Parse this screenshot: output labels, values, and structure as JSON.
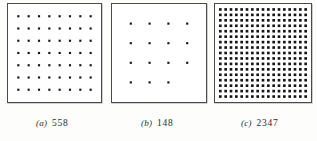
{
  "figure": {
    "background_color": "#fdfdfc",
    "dot_color": "#151513",
    "border_color": "#4a4a48"
  },
  "chart_data": {
    "type": "scatter",
    "title": "",
    "xlabel": "",
    "ylabel": "",
    "layout": "three square plates side by side, each filled with a regular square lattice of dots; an italic panel letter and an old-style numeral count are printed below each plate",
    "grid": false,
    "legend": false,
    "panels": [
      {
        "label": "(a)",
        "count_text": "558",
        "count_value": 558,
        "columns": 8,
        "rows": 7,
        "dots_drawn": 56,
        "dot_radius_px": 1.1,
        "density": "sparse",
        "plate": {
          "x": 7,
          "y": 3,
          "width": 95,
          "height": 100
        }
      },
      {
        "label": "(b)",
        "count_text": "148",
        "count_value": 148,
        "columns": 4,
        "rows": 4,
        "dots_drawn": 15,
        "last_row_columns": 3,
        "dot_radius_px": 1.1,
        "density": "very sparse",
        "plate": {
          "x": 111,
          "y": 3,
          "width": 96,
          "height": 100
        }
      },
      {
        "label": "(c)",
        "count_text": "2347",
        "count_value": 2347,
        "columns": 17,
        "rows": 17,
        "dots_drawn": 289,
        "dot_radius_px": 1.35,
        "density": "dense",
        "plate": {
          "x": 214,
          "y": 3,
          "width": 98,
          "height": 100
        }
      }
    ]
  },
  "captions": {
    "a": {
      "label": "(a)",
      "number": "558"
    },
    "b": {
      "label": "(b)",
      "number": "148"
    },
    "c": {
      "label": "(c)",
      "number": "2347"
    }
  }
}
